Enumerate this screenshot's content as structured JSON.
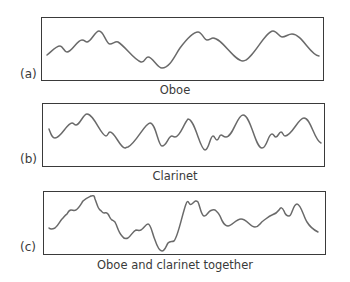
{
  "panels": [
    {
      "letter": "(a)",
      "caption": "Oboe"
    },
    {
      "letter": "(b)",
      "caption": "Clarinet"
    },
    {
      "letter": "(c)",
      "caption": "Oboe and clarinet together"
    }
  ],
  "colors": {
    "frame": "#3a3a3a",
    "wave": "#6a6a6a",
    "background": "#ffffff"
  }
}
